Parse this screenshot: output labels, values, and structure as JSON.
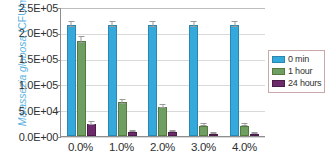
{
  "chart_data": {
    "type": "bar",
    "title": "",
    "xlabel": "",
    "ylabel_plain": "Malassezia globosa (CFU/mL)",
    "ylabel_italic_part": "Malassezia globosa",
    "ylabel_roman_part": " (CFU/mL)",
    "categories": [
      "0.0%",
      "1.0%",
      "2.0%",
      "3.0%",
      "4.0%"
    ],
    "series": [
      {
        "name": "0 min",
        "color": "#35a8dc",
        "values": [
          215000,
          215000,
          215000,
          215000,
          215000
        ],
        "errors": [
          6000,
          6000,
          6000,
          6000,
          6000
        ]
      },
      {
        "name": "1 hour",
        "color": "#6f9e63",
        "values": [
          185000,
          65000,
          57000,
          20000,
          20000
        ],
        "errors": [
          6000,
          4000,
          4000,
          3000,
          3000
        ]
      },
      {
        "name": "24 hours",
        "color": "#6d2a6b",
        "values": [
          24000,
          7500,
          7500,
          4500,
          4000
        ],
        "errors": [
          4000,
          2500,
          2500,
          2000,
          2000
        ]
      }
    ],
    "ylim": [
      0,
      250000
    ],
    "ytick_values": [
      0,
      50000,
      100000,
      150000,
      200000,
      250000
    ],
    "ytick_labels": [
      "0.0E+00",
      "5.0E+04",
      "1.0E+05",
      "1.5E+05",
      "2.0E+05",
      "2.5E+05"
    ],
    "grid": true,
    "legend_position": "right"
  },
  "legend": {
    "items": [
      {
        "label": "0 min"
      },
      {
        "label": "1 hour"
      },
      {
        "label": "24 hours"
      }
    ]
  },
  "colors": {
    "series_0": "#35a8dc",
    "series_1": "#6f9e63",
    "series_2": "#6d2a6b",
    "axis": "#8e8e8e",
    "grid": "#d9d9d9",
    "ylabel_text": "#5cb3de",
    "tick_text": "#2f2f2f"
  }
}
